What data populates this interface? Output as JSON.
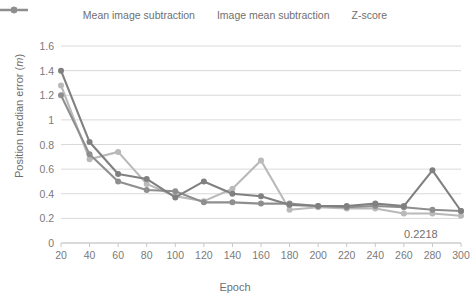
{
  "legend": {
    "position": "top-center",
    "items": [
      {
        "label": "Mean image subtraction",
        "color": "#808080",
        "marker": "circle"
      },
      {
        "label": "Image mean subtraction",
        "color": "#b9b9b9",
        "marker": "circle"
      },
      {
        "label": "Z-score",
        "color": "#8e8e8e",
        "marker": "circle"
      }
    ]
  },
  "axes": {
    "ylabel_text": "Position median error (",
    "ylabel_unit": "m",
    "ylabel_close": ")",
    "xlabel": "Epoch",
    "yticks": [
      "0",
      "0.2",
      "0.4",
      "0.6",
      "0.8",
      "1",
      "1.2",
      "1.4",
      "1.6"
    ],
    "xticks": [
      "20",
      "40",
      "60",
      "80",
      "100",
      "120",
      "140",
      "160",
      "180",
      "200",
      "220",
      "240",
      "260",
      "280",
      "300"
    ]
  },
  "annotation": {
    "text": "0.2218"
  },
  "chart_data": {
    "type": "line",
    "title": "",
    "xlabel": "Epoch",
    "ylabel": "Position median error (m)",
    "xlim": [
      20,
      300
    ],
    "ylim": [
      0,
      1.6
    ],
    "ytick_step": 0.2,
    "xtick_step": 20,
    "grid": true,
    "legend_position": "top-center",
    "x": [
      20,
      40,
      60,
      80,
      100,
      120,
      140,
      160,
      180,
      200,
      220,
      240,
      260,
      280,
      300
    ],
    "series": [
      {
        "name": "Mean image subtraction",
        "color": "#808080",
        "values": [
          1.4,
          0.82,
          0.56,
          0.52,
          0.37,
          0.5,
          0.4,
          0.38,
          0.31,
          0.3,
          0.3,
          0.32,
          0.3,
          0.59,
          0.26
        ]
      },
      {
        "name": "Image mean subtraction",
        "color": "#b9b9b9",
        "values": [
          1.28,
          0.68,
          0.74,
          0.48,
          0.38,
          0.34,
          0.44,
          0.67,
          0.27,
          0.29,
          0.28,
          0.28,
          0.24,
          0.24,
          0.2218
        ]
      },
      {
        "name": "Z-score",
        "color": "#8e8e8e",
        "values": [
          1.2,
          0.72,
          0.5,
          0.43,
          0.42,
          0.33,
          0.33,
          0.32,
          0.32,
          0.3,
          0.29,
          0.3,
          0.29,
          0.27,
          0.26
        ]
      }
    ],
    "annotations": [
      {
        "text": "0.2218",
        "x": 300,
        "series": "Image mean subtraction"
      }
    ]
  }
}
